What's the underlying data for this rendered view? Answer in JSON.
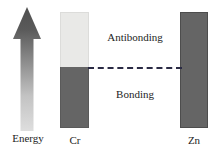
{
  "diagram": {
    "axis": {
      "energy_label": "Energy",
      "direction": "up"
    },
    "regions": {
      "antibonding_label": "Antibonding",
      "bonding_label": "Bonding"
    },
    "bars": [
      {
        "id": "cr",
        "label": "Cr",
        "segments": [
          {
            "region": "antibonding",
            "fill": "light",
            "color": "#e9e9e7"
          },
          {
            "region": "bonding",
            "fill": "dark",
            "color": "#656565"
          }
        ]
      },
      {
        "id": "zn",
        "label": "Zn",
        "segments": [
          {
            "region": "full",
            "fill": "dark",
            "color": "#656565"
          }
        ]
      }
    ],
    "divider": {
      "style": "dashed",
      "color": "#2a2a44"
    },
    "colors": {
      "arrow_top": "#4f4f4f",
      "arrow_bottom": "#dddddd",
      "filled": "#656565",
      "empty": "#e9e9e7",
      "dash": "#2a2a44",
      "text": "#1d1d1d",
      "background": "#ffffff"
    }
  }
}
